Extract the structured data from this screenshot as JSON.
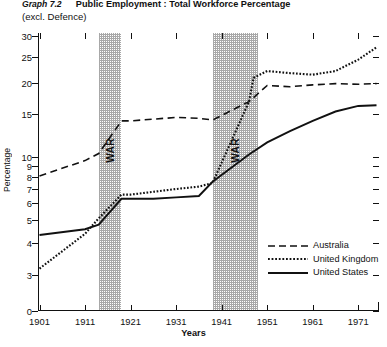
{
  "title": {
    "graph_number": "Graph 7.2",
    "main": "Public Employment : Total Workforce Percentage",
    "subtitle": "(excl. Defence)"
  },
  "axes": {
    "y_title": "Percentage",
    "x_title": "Years",
    "y_ticks": [
      "30",
      "25",
      "20",
      "15",
      "10",
      "9",
      "8",
      "7",
      "6",
      "5",
      "4",
      "3",
      "0"
    ],
    "x_ticks": [
      "1901",
      "1911",
      "1921",
      "1931",
      "1941",
      "1951",
      "1961",
      "1971"
    ]
  },
  "annotations": {
    "war1": "WAR",
    "war2": "WAR"
  },
  "legend": {
    "items": [
      {
        "label": "Australia",
        "style": "dashed"
      },
      {
        "label": "United Kingdom",
        "style": "dotted"
      },
      {
        "label": "United States",
        "style": "solid"
      }
    ]
  },
  "colors": {
    "ink": "#111111",
    "band": "#9a9a9a",
    "background": "#ffffff"
  },
  "chart_data": {
    "type": "line",
    "title": "Graph 7.2 Public Employment : Total Workforce Percentage (excl. Defence)",
    "xlabel": "Years",
    "ylabel": "Percentage",
    "xlim": [
      1901,
      1975
    ],
    "ylim": [
      0,
      31
    ],
    "y_scale": "log-like (3 to 30, with 0 break at base)",
    "y_tick_values": [
      30,
      25,
      20,
      15,
      10,
      9,
      8,
      7,
      6,
      5,
      4,
      3,
      0
    ],
    "x_tick_values": [
      1901,
      1911,
      1921,
      1931,
      1941,
      1951,
      1961,
      1971
    ],
    "grid": false,
    "legend_position": "lower-right",
    "shaded_regions": [
      {
        "label": "WAR",
        "x0": 1914,
        "x1": 1919
      },
      {
        "label": "WAR",
        "x0": 1939,
        "x1": 1949
      }
    ],
    "series": [
      {
        "name": "Australia",
        "style": "dashed",
        "points": [
          [
            1901,
            8.1
          ],
          [
            1911,
            9.6
          ],
          [
            1914,
            10.4
          ],
          [
            1919,
            14.2
          ],
          [
            1921,
            14.2
          ],
          [
            1926,
            14.4
          ],
          [
            1931,
            14.6
          ],
          [
            1936,
            14.5
          ],
          [
            1939,
            14.3
          ],
          [
            1947,
            17.0
          ],
          [
            1951,
            19.6
          ],
          [
            1956,
            19.4
          ],
          [
            1961,
            19.7
          ],
          [
            1966,
            19.9
          ],
          [
            1971,
            19.8
          ],
          [
            1975,
            19.9
          ]
        ]
      },
      {
        "name": "United Kingdom",
        "style": "dotted",
        "points": [
          [
            1901,
            3.2
          ],
          [
            1911,
            4.4
          ],
          [
            1914,
            5.1
          ],
          [
            1919,
            6.6
          ],
          [
            1921,
            6.6
          ],
          [
            1926,
            6.8
          ],
          [
            1931,
            7.0
          ],
          [
            1936,
            7.2
          ],
          [
            1939,
            7.5
          ],
          [
            1947,
            17.0
          ],
          [
            1948,
            21.0
          ],
          [
            1951,
            22.3
          ],
          [
            1956,
            21.9
          ],
          [
            1961,
            21.6
          ],
          [
            1966,
            22.3
          ],
          [
            1971,
            24.5
          ],
          [
            1975,
            27.3
          ]
        ]
      },
      {
        "name": "United States",
        "style": "solid",
        "points": [
          [
            1901,
            4.35
          ],
          [
            1911,
            4.6
          ],
          [
            1914,
            4.8
          ],
          [
            1919,
            6.3
          ],
          [
            1921,
            6.3
          ],
          [
            1926,
            6.3
          ],
          [
            1931,
            6.4
          ],
          [
            1936,
            6.5
          ],
          [
            1939,
            7.6
          ],
          [
            1947,
            10.3
          ],
          [
            1951,
            11.7
          ],
          [
            1956,
            13.0
          ],
          [
            1961,
            14.2
          ],
          [
            1966,
            15.4
          ],
          [
            1971,
            16.3
          ],
          [
            1975,
            16.4
          ]
        ]
      }
    ]
  }
}
